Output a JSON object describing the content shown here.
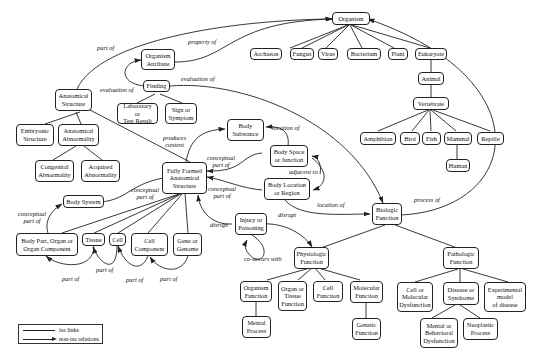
{
  "diagram": {
    "nodes": {
      "organism": "Organism",
      "archaeon": "Archaeon",
      "fungus": "Fungus",
      "virus": "Virus",
      "bacterium": "Bacterium",
      "plant": "Plant",
      "eukaryote": "Eukaryote",
      "animal": "Animal",
      "vertebrate": "Vertebrate",
      "amphibian": "Amphibian",
      "bird": "Bird",
      "fish": "Fish",
      "mammal": "Mammal",
      "reptile": "Reptile",
      "human": "Human",
      "organism_attribute": "Organism\nAttribute",
      "finding": "Finding",
      "lab_result": "Laboratory or\nTest Result",
      "sign_symptom": "Sign or\nSymptom",
      "anatomical_structure": "Anatomical\nStructure",
      "embryonic_structure": "Embryonic\nStructure",
      "anatomical_abnormality": "Anatomical\nAbnormality",
      "congenital_abnormality": "Congenital\nAbnormality",
      "acquired_abnormality": "Acquired\nAbnormality",
      "body_substance": "Body\nSubstance",
      "fully_formed": "Fully Formed\nAnatomical\nStructure",
      "body_space": "Body Space\nor Junction",
      "body_location": "Body Location\nor Region",
      "body_system": "Body System",
      "body_part": "Body Part, Organ or\nOrgan Component",
      "tissue": "Tissue",
      "cell": "Cell",
      "cell_component": "Cell\nComponent",
      "gene": "Gene or\nGenome",
      "injury": "Injury or\nPoisoning",
      "biologic_function": "Biologic\nFunction",
      "physiologic_function": "Physiologic\nFunction",
      "pathologic_function": "Pathologic\nFunction",
      "organism_function": "Organism\nFunction",
      "organ_tissue_function": "Organ or\nTissue\nFunction",
      "cell_function": "Cell\nFunction",
      "molecular_function": "Molecular\nFunction",
      "mental_process": "Mental\nProcess",
      "genetic_function": "Genetic\nFunction",
      "cell_dysfunction": "Cell or\nMolecular\nDysfunction",
      "disease": "Disease or\nSyndrome",
      "experimental_model": "Experimental\nmodel\nof disease",
      "mental_dysfunction": "Mental or\nBehavioral\nDysfunction",
      "neoplastic": "Neoplastic\nProcess"
    },
    "edge_labels": {
      "part_of_top": "part of",
      "property_of": "property of",
      "evaluation_of_1": "evaluation of",
      "evaluation_of_2": "evaluation of",
      "produces_content": "produces\ncontent",
      "location_of_1": "location of",
      "conceptual_part_of_1": "conceptual\npart of",
      "adjacent_to": "adjacent to",
      "conceptual_part_of_2": "conceptual\npart of",
      "conceptual_part_of_3": "conceptual\npart of",
      "conceptual_part_of_4": "conceptual\npart of",
      "location_of_2": "location of",
      "process_of": "process of",
      "disrupt_1": "disrupt",
      "disrupt_2": "disrupt",
      "co_occurs_with": "co-occurs with",
      "part_of_1": "part of",
      "part_of_2": "part of",
      "part_of_3": "part of",
      "part_of_4": "part of"
    },
    "legend": {
      "isa": "isa links",
      "non_isa": "non-isa relations"
    }
  }
}
